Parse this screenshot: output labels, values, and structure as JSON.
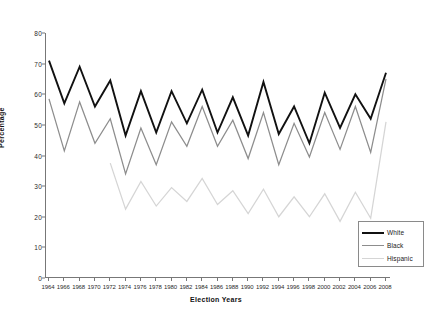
{
  "chart_data": {
    "type": "line",
    "title": "",
    "xlabel": "Election Years",
    "ylabel": "Percentage",
    "ylim": [
      0,
      80
    ],
    "ytick_values": [
      0,
      10,
      20,
      30,
      40,
      50,
      60,
      70,
      80
    ],
    "grid": false,
    "legend_position": "bottom-right",
    "categories": [
      1964,
      1966,
      1968,
      1970,
      1972,
      1974,
      1976,
      1978,
      1980,
      1982,
      1984,
      1986,
      1988,
      1990,
      1992,
      1994,
      1996,
      1998,
      2000,
      2002,
      2004,
      2006,
      2008
    ],
    "series": [
      {
        "name": "White",
        "color": "#111111",
        "values": [
          71,
          57,
          69,
          56,
          64.5,
          46.5,
          61,
          47.5,
          61,
          50.5,
          61.5,
          47.5,
          59,
          46.5,
          64,
          47,
          56,
          44,
          60.5,
          49,
          60,
          52,
          67
        ]
      },
      {
        "name": "Black",
        "color": "#8d8d8d",
        "values": [
          58.5,
          41.5,
          57.5,
          44,
          52,
          34,
          49,
          37,
          51,
          43,
          56,
          43,
          51.5,
          39,
          54,
          37,
          50.5,
          39.5,
          54,
          42,
          56,
          41,
          65
        ]
      },
      {
        "name": "Hispanic",
        "color": "#d5d5d5",
        "values": [
          null,
          null,
          null,
          null,
          37.5,
          22.5,
          31.5,
          23.5,
          29.5,
          25,
          32.5,
          24,
          28.5,
          21,
          29,
          20,
          26.5,
          20,
          27.5,
          18.5,
          28,
          19.5,
          51
        ]
      }
    ]
  },
  "legend": {
    "items": [
      {
        "label": "White"
      },
      {
        "label": "Black"
      },
      {
        "label": "Hispanic"
      }
    ]
  }
}
